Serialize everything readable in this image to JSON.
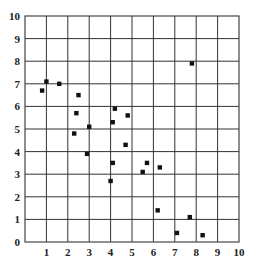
{
  "chart_data": {
    "type": "scatter",
    "title": "",
    "xlabel": "",
    "ylabel": "",
    "xlim": [
      0,
      10
    ],
    "ylim": [
      0,
      10
    ],
    "grid": true,
    "legend": null,
    "x_ticks": [
      "1",
      "2",
      "3",
      "4",
      "5",
      "6",
      "7",
      "8",
      "9",
      "10"
    ],
    "y_ticks": [
      "0",
      "1",
      "2",
      "3",
      "4",
      "5",
      "6",
      "7",
      "8",
      "9",
      "10"
    ],
    "marker": "square",
    "series": [
      {
        "name": "points",
        "points": [
          {
            "x": 0.8,
            "y": 6.7
          },
          {
            "x": 1.0,
            "y": 7.1
          },
          {
            "x": 1.6,
            "y": 7.0
          },
          {
            "x": 2.5,
            "y": 6.5
          },
          {
            "x": 2.4,
            "y": 5.7
          },
          {
            "x": 2.3,
            "y": 4.8
          },
          {
            "x": 3.0,
            "y": 5.1
          },
          {
            "x": 2.9,
            "y": 3.9
          },
          {
            "x": 4.2,
            "y": 5.9
          },
          {
            "x": 4.1,
            "y": 5.3
          },
          {
            "x": 4.8,
            "y": 5.6
          },
          {
            "x": 4.7,
            "y": 4.3
          },
          {
            "x": 4.1,
            "y": 3.5
          },
          {
            "x": 4.0,
            "y": 2.7
          },
          {
            "x": 5.7,
            "y": 3.5
          },
          {
            "x": 5.5,
            "y": 3.1
          },
          {
            "x": 6.3,
            "y": 3.3
          },
          {
            "x": 6.2,
            "y": 1.4
          },
          {
            "x": 7.8,
            "y": 7.9
          },
          {
            "x": 7.7,
            "y": 1.1
          },
          {
            "x": 7.1,
            "y": 0.4
          },
          {
            "x": 8.3,
            "y": 0.3
          }
        ]
      }
    ]
  },
  "style": {
    "grid_color": "#333333",
    "frame_color": "#444444",
    "marker_color": "#111111",
    "background": "#ffffff"
  }
}
